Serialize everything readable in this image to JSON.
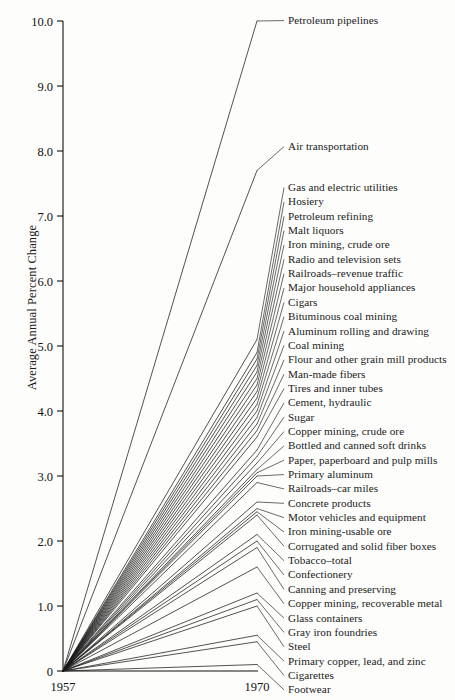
{
  "figure": {
    "ylabel": "Average Annual Percent Change",
    "y_ticks": [
      "0",
      "1.0",
      "2.0",
      "3.0",
      "4.0",
      "5.0",
      "6.0",
      "7.0",
      "8.0",
      "9.0",
      "10.0"
    ],
    "x_ticks": [
      "1957",
      "1970"
    ]
  },
  "chart_data": {
    "type": "line",
    "title": "",
    "xlabel": "",
    "ylabel": "Average Annual Percent Change",
    "x": [
      "1957",
      "1970"
    ],
    "ylim": [
      0,
      10
    ],
    "xlim": [
      "1957",
      "1970"
    ],
    "grid": false,
    "legend": "right-side direct labels with leader lines",
    "note": "Slopegraph: every series starts at 0 in 1957 and rises to its 1970 average annual percent change.",
    "series": [
      {
        "name": "Petroleum pipelines",
        "values": [
          0,
          10.0
        ]
      },
      {
        "name": "Air transportation",
        "values": [
          0,
          7.7
        ]
      },
      {
        "name": "Gas and electric utilities",
        "values": [
          0,
          5.1
        ]
      },
      {
        "name": "Hosiery",
        "values": [
          0,
          4.9
        ]
      },
      {
        "name": "Petroleum refining",
        "values": [
          0,
          4.8
        ]
      },
      {
        "name": "Malt liquors",
        "values": [
          0,
          4.7
        ]
      },
      {
        "name": "Iron mining, crude ore",
        "values": [
          0,
          4.6
        ]
      },
      {
        "name": "Radio and television sets",
        "values": [
          0,
          4.5
        ]
      },
      {
        "name": "Railroads–revenue traffic",
        "values": [
          0,
          4.4
        ]
      },
      {
        "name": "Major household appliances",
        "values": [
          0,
          4.3
        ]
      },
      {
        "name": "Cigars",
        "values": [
          0,
          4.2
        ]
      },
      {
        "name": "Bituminous coal mining",
        "values": [
          0,
          4.1
        ]
      },
      {
        "name": "Aluminum rolling and drawing",
        "values": [
          0,
          4.0
        ]
      },
      {
        "name": "Coal mining",
        "values": [
          0,
          3.9
        ]
      },
      {
        "name": "Flour and other grain mill products",
        "values": [
          0,
          3.8
        ]
      },
      {
        "name": "Man-made fibers",
        "values": [
          0,
          3.7
        ]
      },
      {
        "name": "Tires and inner tubes",
        "values": [
          0,
          3.6
        ]
      },
      {
        "name": "Cement, hydraulic",
        "values": [
          0,
          3.4
        ]
      },
      {
        "name": "Sugar",
        "values": [
          0,
          3.3
        ]
      },
      {
        "name": "Copper mining, crude ore",
        "values": [
          0,
          3.2
        ]
      },
      {
        "name": "Bottled and canned soft drinks",
        "values": [
          0,
          3.1
        ]
      },
      {
        "name": "Paper, paperboard and pulp mills",
        "values": [
          0,
          3.05
        ]
      },
      {
        "name": "Primary aluminum",
        "values": [
          0,
          3.0
        ]
      },
      {
        "name": "Railroads–car miles",
        "values": [
          0,
          2.9
        ]
      },
      {
        "name": "Concrete products",
        "values": [
          0,
          2.6
        ]
      },
      {
        "name": "Motor vehicles and equipment",
        "values": [
          0,
          2.5
        ]
      },
      {
        "name": "Iron mining-usable ore",
        "values": [
          0,
          2.45
        ]
      },
      {
        "name": "Corrugated and solid fiber boxes",
        "values": [
          0,
          2.4
        ]
      },
      {
        "name": "Tobacco–total",
        "values": [
          0,
          2.1
        ]
      },
      {
        "name": "Confectionery",
        "values": [
          0,
          2.0
        ]
      },
      {
        "name": "Canning and preserving",
        "values": [
          0,
          1.9
        ]
      },
      {
        "name": "Copper mining, recoverable metal",
        "values": [
          0,
          1.6
        ]
      },
      {
        "name": "Glass containers",
        "values": [
          0,
          1.2
        ]
      },
      {
        "name": "Gray iron foundries",
        "values": [
          0,
          1.1
        ]
      },
      {
        "name": "Steel",
        "values": [
          0,
          1.0
        ]
      },
      {
        "name": "Primary copper, lead, and zinc",
        "values": [
          0,
          0.55
        ]
      },
      {
        "name": "Cigarettes",
        "values": [
          0,
          0.45
        ]
      },
      {
        "name": "Footwear",
        "values": [
          0,
          0.1
        ]
      }
    ],
    "labels_in_order": [
      "Petroleum pipelines",
      "Air transportation",
      "Gas and electric utilities",
      "Hosiery",
      "Petroleum refining",
      "Malt liquors",
      "Iron mining, crude ore",
      "Radio and television sets",
      "Railroads–revenue traffic",
      "Major household appliances",
      "Cigars",
      "Bituminous coal mining",
      "Aluminum rolling and drawing",
      "Coal mining",
      "Flour and other grain mill products",
      "Man-made fibers",
      "Tires and inner tubes",
      "Cement, hydraulic",
      "Sugar",
      "Copper mining, crude ore",
      "Bottled and canned soft drinks",
      "Paper, paperboard and pulp mills",
      "Primary aluminum",
      "Railroads–car miles",
      "Concrete products",
      "Motor vehicles and equipment",
      "Iron mining-usable ore",
      "Corrugated and solid fiber boxes",
      "Tobacco–total",
      "Confectionery",
      "Canning and preserving",
      "Copper mining, recoverable metal",
      "Glass containers",
      "Gray iron foundries",
      "Steel",
      "Primary copper, lead, and zinc",
      "Cigarettes",
      "Footwear"
    ]
  },
  "colors": {
    "line": "#1a1a1a",
    "axis": "#111111",
    "background": "#fdfdfb",
    "text": "#1a1a1a"
  }
}
